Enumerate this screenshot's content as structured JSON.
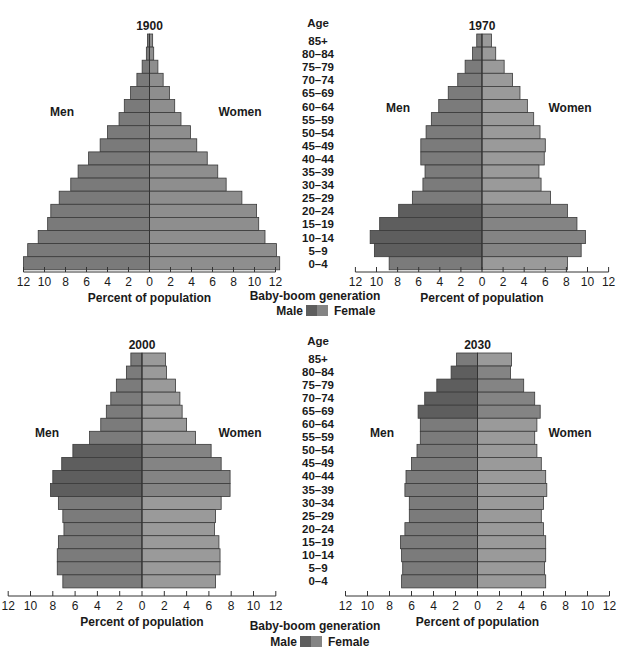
{
  "figure": {
    "age_header": "Age",
    "side_label_left": "Men",
    "side_label_right": "Women",
    "xlabel": "Percent of population",
    "legend": {
      "title": "Baby-boom generation",
      "male_label": "Male",
      "female_label": "Female"
    },
    "colors": {
      "male": "#7b7b7b",
      "female": "#9a9a9a",
      "male_boom": "#5e5e5e",
      "female_boom": "#848484",
      "male_1900": "#7a7a7a",
      "female_1900": "#8e8e8e",
      "separator": "#3a3a3a"
    }
  },
  "chart_data": [
    {
      "type": "bar",
      "title": "1900",
      "orientation": "horizontal-pyramid",
      "categories": [
        "85+",
        "80-84",
        "75-79",
        "70-74",
        "65-69",
        "60-64",
        "55-59",
        "50-54",
        "45-49",
        "40-44",
        "35-39",
        "30-34",
        "25-29",
        "20-24",
        "15-19",
        "10-14",
        "5-9",
        "0-4"
      ],
      "series": [
        {
          "name": "Men",
          "values": [
            0.2,
            0.3,
            0.7,
            1.2,
            1.8,
            2.4,
            2.9,
            4.0,
            4.7,
            5.8,
            6.8,
            7.5,
            8.6,
            9.4,
            9.7,
            10.6,
            11.6,
            12.0
          ]
        },
        {
          "name": "Women",
          "values": [
            0.3,
            0.4,
            0.8,
            1.3,
            1.9,
            2.4,
            3.0,
            3.9,
            4.5,
            5.5,
            6.5,
            7.3,
            8.8,
            10.2,
            10.4,
            11.0,
            12.1,
            12.4
          ]
        }
      ],
      "baby_boom_rows": [],
      "xlabel": "Percent of population",
      "ylabel": "Age",
      "xticks": [
        12,
        10,
        8,
        6,
        4,
        2,
        0,
        2,
        4,
        6,
        8,
        10,
        12
      ],
      "xlim": [
        -12,
        12
      ],
      "grid": false
    },
    {
      "type": "bar",
      "title": "1970",
      "orientation": "horizontal-pyramid",
      "categories": [
        "85+",
        "80-84",
        "75-79",
        "70-74",
        "65-69",
        "60-64",
        "55-59",
        "50-54",
        "45-49",
        "40-44",
        "35-39",
        "30-34",
        "25-29",
        "20-24",
        "15-19",
        "10-14",
        "5-9",
        "0-4"
      ],
      "series": [
        {
          "name": "Men",
          "values": [
            0.5,
            0.9,
            1.6,
            2.3,
            3.2,
            4.1,
            4.8,
            5.3,
            5.8,
            5.8,
            5.4,
            5.6,
            6.6,
            7.9,
            9.7,
            10.6,
            10.2,
            8.8
          ]
        },
        {
          "name": "Women",
          "values": [
            0.9,
            1.3,
            2.1,
            2.9,
            3.6,
            4.3,
            4.9,
            5.5,
            6.0,
            5.9,
            5.4,
            5.6,
            6.5,
            8.1,
            9.0,
            9.8,
            9.4,
            8.1
          ]
        }
      ],
      "baby_boom_rows": [
        "20-24",
        "15-19",
        "10-14",
        "5-9"
      ],
      "xlabel": "Percent of population",
      "ylabel": "Age",
      "xticks": [
        12,
        10,
        8,
        6,
        4,
        2,
        0,
        2,
        4,
        6,
        8,
        10,
        12
      ],
      "xlim": [
        -12,
        12
      ],
      "grid": false
    },
    {
      "type": "bar",
      "title": "2000",
      "orientation": "horizontal-pyramid",
      "categories": [
        "85+",
        "80-84",
        "75-79",
        "70-74",
        "65-69",
        "60-64",
        "55-59",
        "50-54",
        "45-49",
        "40-44",
        "35-39",
        "30-34",
        "25-29",
        "20-24",
        "15-19",
        "10-14",
        "5-9",
        "0-4"
      ],
      "series": [
        {
          "name": "Men",
          "values": [
            1.0,
            1.4,
            2.3,
            2.8,
            3.2,
            3.7,
            4.7,
            6.2,
            7.2,
            8.0,
            8.2,
            7.5,
            7.1,
            7.0,
            7.5,
            7.6,
            7.6,
            7.1
          ]
        },
        {
          "name": "Women",
          "values": [
            2.1,
            2.2,
            3.0,
            3.4,
            3.6,
            4.0,
            4.8,
            6.2,
            7.1,
            7.9,
            7.9,
            7.1,
            6.6,
            6.5,
            6.9,
            7.0,
            7.0,
            6.6
          ]
        }
      ],
      "baby_boom_rows": [
        "50-54",
        "45-49",
        "40-44",
        "35-39"
      ],
      "xlabel": "Percent of population",
      "ylabel": "Age",
      "xticks": [
        12,
        10,
        8,
        6,
        4,
        2,
        0,
        2,
        4,
        6,
        8,
        10,
        12
      ],
      "xlim": [
        -12,
        12
      ],
      "grid": false
    },
    {
      "type": "bar",
      "title": "2030",
      "orientation": "horizontal-pyramid",
      "categories": [
        "85+",
        "80-84",
        "75-79",
        "70-74",
        "65-69",
        "60-64",
        "55-59",
        "50-54",
        "45-49",
        "40-44",
        "35-39",
        "30-34",
        "25-29",
        "20-24",
        "15-19",
        "10-14",
        "5-9",
        "0-4"
      ],
      "series": [
        {
          "name": "Men",
          "values": [
            1.9,
            2.4,
            3.7,
            4.8,
            5.4,
            5.2,
            5.2,
            5.5,
            6.0,
            6.5,
            6.6,
            6.2,
            6.2,
            6.6,
            7.0,
            6.9,
            6.8,
            6.9
          ]
        },
        {
          "name": "Women",
          "values": [
            3.1,
            3.0,
            4.2,
            5.2,
            5.7,
            5.4,
            5.2,
            5.4,
            5.8,
            6.2,
            6.3,
            6.0,
            5.8,
            6.0,
            6.2,
            6.2,
            6.1,
            6.2
          ]
        }
      ],
      "baby_boom_rows": [
        "80-84",
        "75-79",
        "70-74",
        "65-69"
      ],
      "xlabel": "Percent of population",
      "ylabel": "Age",
      "xticks": [
        12,
        10,
        8,
        6,
        4,
        2,
        0,
        2,
        4,
        6,
        8,
        10,
        12
      ],
      "xlim": [
        -12,
        12
      ],
      "grid": false
    }
  ]
}
